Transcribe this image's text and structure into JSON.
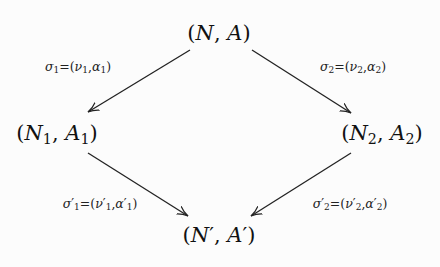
{
  "diagram": {
    "type": "commutative-diagram",
    "nodes": [
      {
        "id": "top",
        "label": "(N, A)",
        "var1": "N",
        "sub1": "",
        "prime": "",
        "var2": "A",
        "sub2": "",
        "x": 219,
        "y": 33
      },
      {
        "id": "left",
        "label": "(N1, A1)",
        "var1": "N",
        "sub1": "1",
        "prime": "",
        "var2": "A",
        "sub2": "1",
        "x": 57,
        "y": 134
      },
      {
        "id": "right",
        "label": "(N2, A2)",
        "var1": "N",
        "sub1": "2",
        "prime": "",
        "var2": "A",
        "sub2": "2",
        "x": 382,
        "y": 134
      },
      {
        "id": "bottom",
        "label": "(N', A')",
        "var1": "N",
        "sub1": "",
        "prime": "′",
        "var2": "A",
        "sub2": "",
        "x": 219,
        "y": 235
      }
    ],
    "edges": [
      {
        "from": "top",
        "to": "left",
        "label": "σ1=(ν1,α1)",
        "sigma": "σ",
        "nu": "ν",
        "alpha": "α",
        "index": "1",
        "prime": "",
        "x1": 190,
        "y1": 50,
        "x2": 88,
        "y2": 112,
        "lx": 78,
        "ly": 67
      },
      {
        "from": "top",
        "to": "right",
        "label": "σ2=(ν2,α2)",
        "sigma": "σ",
        "nu": "ν",
        "alpha": "α",
        "index": "2",
        "prime": "",
        "x1": 252,
        "y1": 50,
        "x2": 351,
        "y2": 113,
        "lx": 353,
        "ly": 67
      },
      {
        "from": "left",
        "to": "bottom",
        "label": "σ'1=(ν'1,α'1)",
        "sigma": "σ",
        "nu": "ν",
        "alpha": "α",
        "index": "1",
        "prime": "′",
        "x1": 88,
        "y1": 153,
        "x2": 188,
        "y2": 216,
        "lx": 100,
        "ly": 204
      },
      {
        "from": "right",
        "to": "bottom",
        "label": "σ'2=(ν'2,α'2)",
        "sigma": "σ",
        "nu": "ν",
        "alpha": "α",
        "index": "2",
        "prime": "′",
        "x1": 351,
        "y1": 153,
        "x2": 251,
        "y2": 216,
        "lx": 350,
        "ly": 204
      }
    ],
    "colors": {
      "line": "#222222",
      "text": "#111111",
      "background": "#fcfcfc"
    }
  }
}
